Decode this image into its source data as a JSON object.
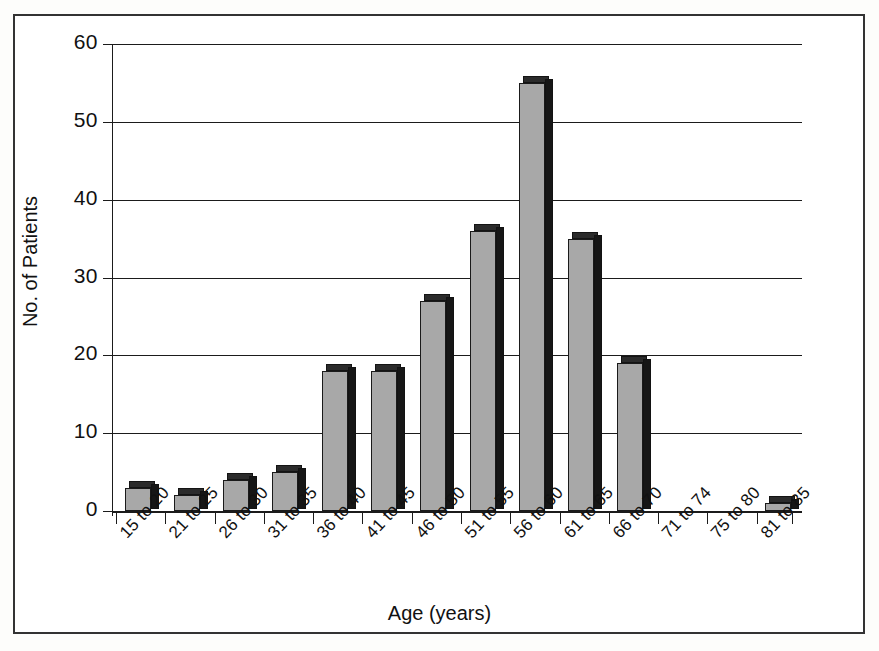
{
  "chart_data": {
    "type": "bar",
    "title": "",
    "xlabel": "Age (years)",
    "ylabel": "No. of Patients",
    "categories": [
      "15 to 20",
      "21 to 25",
      "26 to 30",
      "31 to 35",
      "36 to 40",
      "41 to 45",
      "46 to 50",
      "51 to 55",
      "56 to 60",
      "61 to 65",
      "66 to 70",
      "71 to 74",
      "75 to 80",
      "81 to 85"
    ],
    "values": [
      3,
      2,
      4,
      5,
      18,
      18,
      27,
      36,
      55,
      35,
      19,
      0,
      0,
      1
    ],
    "ylim": [
      0,
      60
    ],
    "yticks": [
      0,
      10,
      20,
      30,
      40,
      50,
      60
    ],
    "ytick_labels": [
      "0",
      "10",
      "20",
      "30",
      "40",
      "50",
      "60"
    ],
    "grid": true,
    "legend": "none",
    "series": [
      {
        "name": "No. of Patients",
        "values": [
          3,
          2,
          4,
          5,
          18,
          18,
          27,
          36,
          55,
          35,
          19,
          0,
          0,
          1
        ]
      }
    ],
    "colors": {
      "bar_face": "#a8a8a8",
      "bar_edge": "#1a1a1a",
      "bar_shadow": "#161616",
      "axis": "#1b1b1b",
      "text": "#111111"
    }
  }
}
